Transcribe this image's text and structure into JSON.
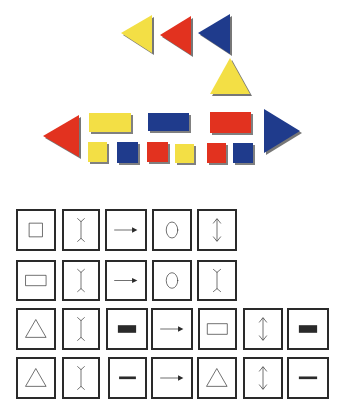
{
  "colors": {
    "yellow": "#f3df45",
    "red": "#e2321f",
    "blue": "#1f3b8c",
    "shadow": "#4a4a4a",
    "stroke": "#2a2a2a"
  },
  "blocks": {
    "triangles": [
      {
        "id": "top-yellow-left",
        "color": "yellow",
        "dir": "left",
        "points": "121,33 152,15 152,53"
      },
      {
        "id": "top-red-left",
        "color": "red",
        "dir": "left",
        "points": "160,35 191,16 191,55"
      },
      {
        "id": "top-blue-left",
        "color": "blue",
        "dir": "left",
        "points": "198,33 230,14 230,54"
      },
      {
        "id": "yellow-up",
        "color": "yellow",
        "dir": "up",
        "points": "230,58 250,94 210,94"
      },
      {
        "id": "red-left-large",
        "color": "red",
        "dir": "left",
        "points": "43,136 79,115 79,157"
      },
      {
        "id": "blue-right-large",
        "color": "blue",
        "dir": "right",
        "points": "300,131 264,109 264,153"
      }
    ],
    "rectangles": [
      {
        "id": "yellow-rect",
        "color": "yellow",
        "x": 89,
        "y": 113,
        "w": 42,
        "h": 19
      },
      {
        "id": "blue-rect",
        "color": "blue",
        "x": 148,
        "y": 113,
        "w": 41,
        "h": 18
      },
      {
        "id": "red-rect",
        "color": "red",
        "x": 210,
        "y": 112,
        "w": 41,
        "h": 21
      }
    ],
    "squares": [
      {
        "id": "sq-yellow-1",
        "color": "yellow",
        "x": 88,
        "y": 142,
        "w": 19,
        "h": 20
      },
      {
        "id": "sq-blue-1",
        "color": "blue",
        "x": 117,
        "y": 142,
        "w": 21,
        "h": 21
      },
      {
        "id": "sq-red-1",
        "color": "red",
        "x": 147,
        "y": 142,
        "w": 21,
        "h": 20
      },
      {
        "id": "sq-yellow-2",
        "color": "yellow",
        "x": 175,
        "y": 144,
        "w": 19,
        "h": 19
      },
      {
        "id": "sq-red-2",
        "color": "red",
        "x": 207,
        "y": 143,
        "w": 19,
        "h": 20
      },
      {
        "id": "sq-blue-2",
        "color": "blue",
        "x": 233,
        "y": 143,
        "w": 20,
        "h": 20
      }
    ]
  },
  "symbol_grid": {
    "rows": [
      {
        "y": 14,
        "h": 42,
        "cells": [
          {
            "x": 16,
            "w": 40,
            "symbol": "square-outline"
          },
          {
            "x": 62,
            "w": 38,
            "symbol": "i-beam"
          },
          {
            "x": 105,
            "w": 42,
            "symbol": "arrow-right"
          },
          {
            "x": 152,
            "w": 40,
            "symbol": "circle-outline"
          },
          {
            "x": 197,
            "w": 40,
            "symbol": "double-arrow-vertical"
          }
        ]
      },
      {
        "y": 65,
        "h": 41,
        "cells": [
          {
            "x": 16,
            "w": 40,
            "symbol": "rectangle-outline"
          },
          {
            "x": 62,
            "w": 38,
            "symbol": "i-beam"
          },
          {
            "x": 105,
            "w": 42,
            "symbol": "arrow-right"
          },
          {
            "x": 152,
            "w": 40,
            "symbol": "circle-outline"
          },
          {
            "x": 197,
            "w": 40,
            "symbol": "i-beam"
          }
        ]
      },
      {
        "y": 113,
        "h": 42,
        "cells": [
          {
            "x": 16,
            "w": 40,
            "symbol": "triangle-outline"
          },
          {
            "x": 62,
            "w": 38,
            "symbol": "i-beam"
          },
          {
            "x": 106,
            "w": 42,
            "symbol": "filled-rectangle"
          },
          {
            "x": 151,
            "w": 42,
            "symbol": "arrow-right"
          },
          {
            "x": 198,
            "w": 39,
            "symbol": "rectangle-outline"
          },
          {
            "x": 243,
            "w": 40,
            "symbol": "double-arrow-vertical"
          },
          {
            "x": 287,
            "w": 42,
            "symbol": "filled-rectangle"
          }
        ]
      },
      {
        "y": 162,
        "h": 42,
        "cells": [
          {
            "x": 16,
            "w": 40,
            "symbol": "triangle-outline"
          },
          {
            "x": 62,
            "w": 38,
            "symbol": "i-beam"
          },
          {
            "x": 108,
            "w": 39,
            "symbol": "thick-dash"
          },
          {
            "x": 151,
            "w": 42,
            "symbol": "arrow-right"
          },
          {
            "x": 197,
            "w": 40,
            "symbol": "triangle-outline"
          },
          {
            "x": 243,
            "w": 40,
            "symbol": "double-arrow-vertical"
          },
          {
            "x": 287,
            "w": 42,
            "symbol": "thick-dash"
          }
        ]
      }
    ]
  }
}
